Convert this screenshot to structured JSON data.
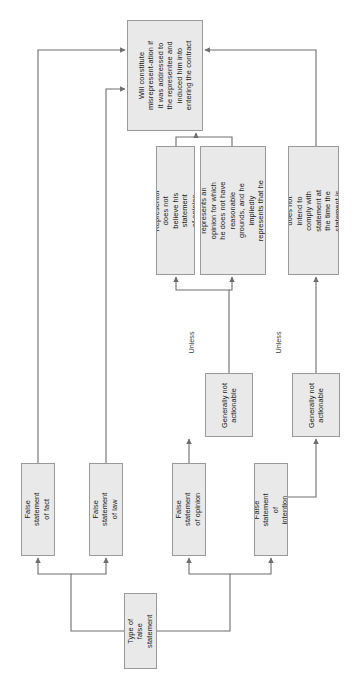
{
  "diagram": {
    "orientation": "text-rotated-90-ccw",
    "colors": {
      "node_fill": "#e9e9e9",
      "node_border": "#9a9a9a",
      "connector": "#6e6e6e",
      "text": "#1a1a1a"
    },
    "nodes": {
      "constitute": "Will constitute misrepresent-ation if it was addressed to the representee and induced him into entering the contract",
      "not_believe": "Representor does not believe his statement of opinion",
      "no_grounds": "Representor represents an opinion for which he does not have reasonable grounds, and he impliedly represents that he has such grounds",
      "no_intent": "Representor does not intend to comply with statement at the time the statement is made",
      "gna_opinion": "Generally not actionable",
      "gna_intention": "Generally not actionable",
      "fs_fact": "False statement of fact",
      "fs_law": "False statement of law",
      "fs_opinion": "False statement of opinion",
      "fs_intention": "False statement of intention",
      "type_of_false_statement": "Type of false statement"
    },
    "edge_labels": {
      "unless_opinion": "Unless",
      "unless_intention": "Unless"
    }
  }
}
